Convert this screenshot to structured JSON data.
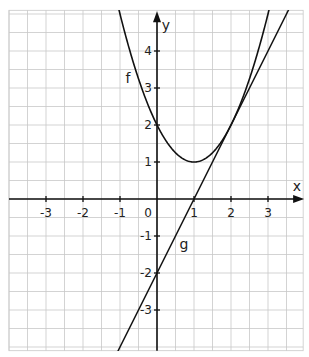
{
  "chart_data": {
    "type": "line",
    "title": "",
    "xlabel": "x",
    "ylabel": "y",
    "xlim": [
      -4,
      3.95
    ],
    "ylim": [
      -4.1,
      5.1
    ],
    "grid": true,
    "grid_step": 0.5,
    "x_ticks": [
      "-3",
      "-2",
      "-1",
      "1",
      "2",
      "3"
    ],
    "y_ticks": [
      "4",
      "3",
      "2",
      "1",
      "-1",
      "-2",
      "-3"
    ],
    "origin_label": "0",
    "series": [
      {
        "name": "f",
        "expression": "f(x) = x^2 - 2x + 2",
        "vertex": [
          1,
          1
        ],
        "points": [
          [
            -1,
            5
          ],
          [
            0,
            2
          ],
          [
            1,
            1
          ],
          [
            2,
            2
          ],
          [
            3,
            5
          ]
        ]
      },
      {
        "name": "g",
        "expression": "g(x) = 2x - 2",
        "points": [
          [
            -1,
            -4
          ],
          [
            0,
            -2
          ],
          [
            1,
            0
          ],
          [
            2,
            2
          ],
          [
            3,
            4
          ]
        ],
        "note": "tangent to f at (2, 2)"
      }
    ],
    "legend": [],
    "annotations": [
      {
        "text": "f",
        "near": [
          -0.8,
          3.3
        ]
      },
      {
        "text": "g",
        "near": [
          0.7,
          -1.3
        ]
      }
    ]
  },
  "labels": {
    "x_axis": "x",
    "y_axis": "y",
    "origin": "0",
    "f": "f",
    "g": "g"
  }
}
